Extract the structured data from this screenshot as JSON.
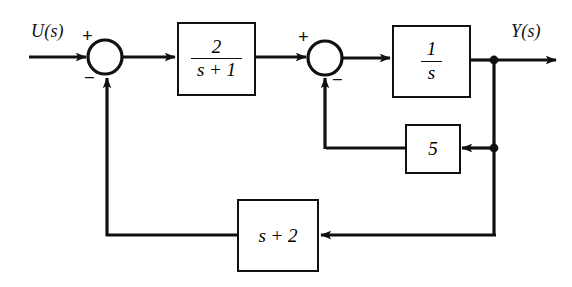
{
  "diagram": {
    "type": "block-diagram",
    "background_color": "#ffffff",
    "line_color": "#101010",
    "signals": {
      "input_label": "U(s)",
      "output_label": "Y(s)"
    },
    "summing_junctions": [
      {
        "name": "summing-junction-1",
        "cx": 105,
        "cy": 57,
        "r": 17,
        "signs": [
          {
            "symbol": "+",
            "position": "top-left",
            "x": 82,
            "y": 28
          },
          {
            "symbol": "−",
            "position": "bottom-left",
            "x": 84,
            "y": 70
          }
        ]
      },
      {
        "name": "summing-junction-2",
        "cx": 325,
        "cy": 58,
        "r": 17,
        "signs": [
          {
            "symbol": "+",
            "position": "top-left",
            "x": 298,
            "y": 29
          },
          {
            "symbol": "−",
            "position": "bottom-right",
            "x": 330,
            "y": 72
          }
        ]
      }
    ],
    "blocks": [
      {
        "name": "block-forward-1",
        "numerator": "2",
        "denominator": "s + 1",
        "is_fraction": true,
        "x": 177,
        "y": 22,
        "width": 79,
        "height": 74
      },
      {
        "name": "block-integrator",
        "numerator": "1",
        "denominator": "s",
        "is_fraction": true,
        "x": 392,
        "y": 25,
        "width": 79,
        "height": 73
      },
      {
        "name": "block-inner-feedback-gain",
        "text": "5",
        "is_fraction": false,
        "x": 405,
        "y": 124,
        "width": 56,
        "height": 50
      },
      {
        "name": "block-outer-feedback",
        "text": "s + 2",
        "is_fraction": false,
        "x": 237,
        "y": 199,
        "width": 82,
        "height": 73
      }
    ],
    "junction_dots": [
      {
        "name": "output-tap-dot",
        "cx": 494,
        "cy": 60,
        "r": 4
      },
      {
        "name": "inner-feedback-tap-dot",
        "cx": 494,
        "cy": 148,
        "r": 4
      }
    ],
    "notes": {
      "inner_loop": "1/s output fed back through gain 5 into summing junction 2 (negative)",
      "outer_loop": "output fed back through (s + 2) into summing junction 1 (negative)"
    }
  }
}
